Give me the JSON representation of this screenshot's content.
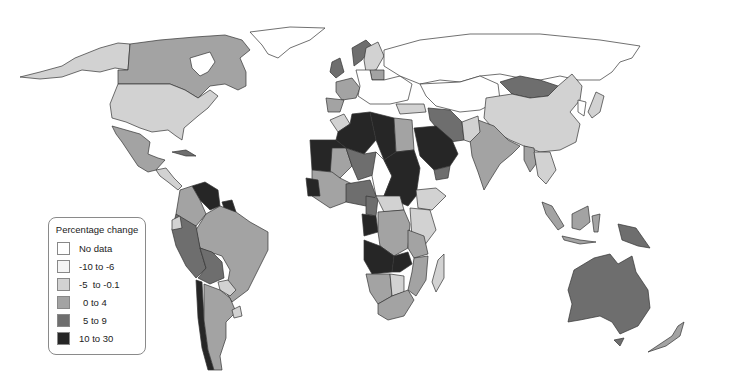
{
  "legend": {
    "title": "Percentage change",
    "items": [
      {
        "label": "No data",
        "color": "#ffffff"
      },
      {
        "label": "-10 to -6",
        "color": "#f4f4f4"
      },
      {
        "label": "-5  to -0.1",
        "color": "#d2d2d2"
      },
      {
        "label": "0 to 4",
        "color": "#a3a3a3"
      },
      {
        "label": "5 to 9",
        "color": "#6e6e6e"
      },
      {
        "label": "10 to 30",
        "color": "#262626"
      }
    ]
  },
  "regions": [
    {
      "name": "Canada",
      "class": "0 to 4"
    },
    {
      "name": "Alaska (USA)",
      "class": "-5 to -0.1"
    },
    {
      "name": "United States",
      "class": "-5 to -0.1"
    },
    {
      "name": "Greenland",
      "class": "No data"
    },
    {
      "name": "Mexico",
      "class": "0 to 4"
    },
    {
      "name": "Venezuela",
      "class": "10 to 30"
    },
    {
      "name": "Brazil",
      "class": "0 to 4"
    },
    {
      "name": "Peru",
      "class": "5 to 9"
    },
    {
      "name": "Bolivia",
      "class": "5 to 9"
    },
    {
      "name": "Chile",
      "class": "10 to 30"
    },
    {
      "name": "Argentina",
      "class": "0 to 4"
    },
    {
      "name": "Russia",
      "class": "No data"
    },
    {
      "name": "Mongolia",
      "class": "5 to 9"
    },
    {
      "name": "China",
      "class": "-5 to -0.1"
    },
    {
      "name": "India",
      "class": "0 to 4"
    },
    {
      "name": "Iran",
      "class": "5 to 9"
    },
    {
      "name": "Saudi Arabia",
      "class": "10 to 30"
    },
    {
      "name": "Algeria",
      "class": "10 to 30"
    },
    {
      "name": "Libya",
      "class": "10 to 30"
    },
    {
      "name": "Sudan",
      "class": "10 to 30"
    },
    {
      "name": "Egypt",
      "class": "0 to 4"
    },
    {
      "name": "Angola",
      "class": "10 to 30"
    },
    {
      "name": "DR Congo",
      "class": "0 to 4"
    },
    {
      "name": "Australia",
      "class": "5 to 9"
    },
    {
      "name": "Indonesia",
      "class": "0 to 4"
    },
    {
      "name": "Papua New Guinea",
      "class": "5 to 9"
    }
  ]
}
